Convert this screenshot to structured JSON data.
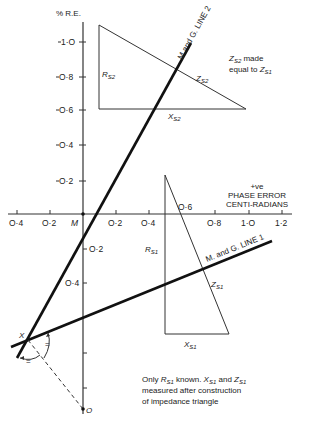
{
  "figure": {
    "y_axis_label": "% R.E.",
    "x_axis_label_line1": "+ve",
    "x_axis_label_line2": "PHASE ERROR",
    "x_axis_label_line3": "CENTI-RADIANS",
    "origin_label": "M",
    "y_ticks_positive": [
      "O·2",
      "O·4",
      "O·6",
      "O·8",
      "1·O"
    ],
    "y_ticks_negative": [
      "O·2",
      "O·4"
    ],
    "x_ticks_negative": [
      "O·4",
      "O·2"
    ],
    "x_ticks_positive": [
      "O·2",
      "O·4",
      "O·6",
      "O·8",
      "1·O",
      "1·2"
    ],
    "line1_label": "M. and G. LINE 1",
    "line2_label": "M.and G. LINE 2",
    "point_x_label": "X",
    "point_o_label": "O",
    "equal_mark": "=",
    "upper_triangle": {
      "r_label": "R",
      "r_sub": "S2",
      "x_label": "X",
      "x_sub": "S2",
      "z_label": "Z",
      "z_sub": "S2"
    },
    "lower_triangle": {
      "r_label": "R",
      "r_sub": "S1",
      "x_label": "X",
      "x_sub": "S1",
      "z_label": "Z",
      "z_sub": "S1"
    },
    "note_upper": {
      "line1_z": "Z",
      "line1_sub": "S2",
      "line1_rest": " made",
      "line2_pre": "equal to ",
      "line2_z": "Z",
      "line2_sub": "S1"
    },
    "note_lower": {
      "line1_pre": "Only ",
      "line1_r": "R",
      "line1_r_sub": "S1",
      "line1_mid": " known. ",
      "line1_x": "X",
      "line1_x_sub": "S1",
      "line1_and": " and ",
      "line1_z": "Z",
      "line1_z_sub": "S1",
      "line2": "measured  after  construction",
      "line3": "of  impedance triangle"
    }
  }
}
